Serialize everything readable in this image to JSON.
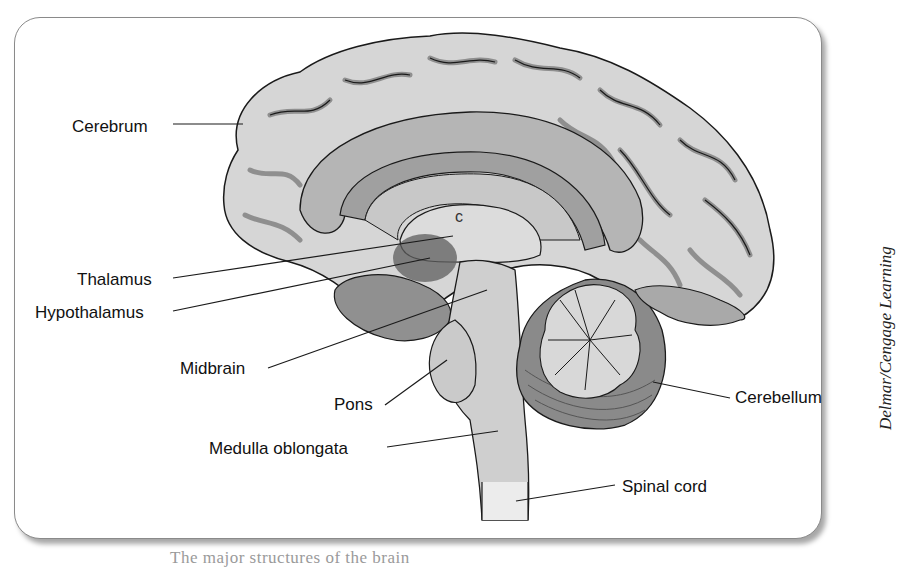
{
  "figure": {
    "credit": "Delmar/Cengage Learning",
    "caption_partial": "The major structures of the brain"
  },
  "labels": [
    {
      "id": "cerebrum",
      "text": "Cerebrum",
      "x": 72,
      "y": 118,
      "anchor": "right",
      "line": [
        173,
        124,
        243,
        124
      ]
    },
    {
      "id": "thalamus",
      "text": "Thalamus",
      "x": 77,
      "y": 271,
      "anchor": "right",
      "line": [
        173,
        278,
        453,
        236
      ]
    },
    {
      "id": "hypothalamus",
      "text": "Hypothalamus",
      "x": 35,
      "y": 304,
      "anchor": "right",
      "line": [
        173,
        311,
        430,
        258
      ]
    },
    {
      "id": "midbrain",
      "text": "Midbrain",
      "x": 180,
      "y": 360,
      "anchor": "right",
      "line": [
        268,
        368,
        487,
        290
      ]
    },
    {
      "id": "pons",
      "text": "Pons",
      "x": 334,
      "y": 396,
      "anchor": "right",
      "line": [
        385,
        405,
        447,
        360
      ]
    },
    {
      "id": "medulla",
      "text": "Medulla oblongata",
      "x": 209,
      "y": 440,
      "anchor": "right",
      "line": [
        387,
        447,
        498,
        431
      ]
    },
    {
      "id": "cerebellum",
      "text": "Cerebellum",
      "x": 735,
      "y": 389,
      "anchor": "left",
      "line": [
        653,
        382,
        730,
        398
      ]
    },
    {
      "id": "spinal_cord",
      "text": "Spinal cord",
      "x": 622,
      "y": 478,
      "anchor": "left",
      "line": [
        516,
        501,
        615,
        485
      ]
    }
  ],
  "colors": {
    "cortex_light": "#d9d9d9",
    "cortex_mid": "#a8a8a8",
    "sulcus": "#8c8c8c",
    "dark_region": "#6e6e6e",
    "brainstem": "#cfcfcf",
    "cerebellum_dark": "#8a8a8a",
    "outline": "#1a1a1a"
  }
}
